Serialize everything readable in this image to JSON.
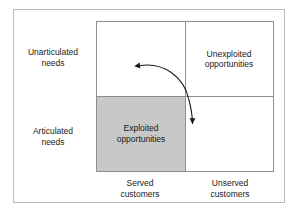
{
  "figure": {
    "colors": {
      "shaded_quadrant": "#c8c8c8",
      "matrix_border": "#8d8d8d",
      "outer_frame": "#b9b9b9",
      "arrow": "#1a1a1a",
      "text": "#1a1a1a",
      "background": "#ffffff"
    }
  },
  "axes": {
    "vertical": {
      "upper_label": "Unarticulated\nneeds",
      "lower_label": "Articulated\nneeds"
    },
    "horizontal": {
      "left_label": "Served\ncustomers",
      "right_label": "Unserved\ncustomers"
    }
  },
  "quadrants": {
    "top_left": {
      "label": "",
      "shaded": false
    },
    "top_right": {
      "label": "Unexploited\nopportunities",
      "shaded": false
    },
    "bottom_left": {
      "label": "Exploited\nopportunities",
      "shaded": true
    },
    "bottom_right": {
      "label": "",
      "shaded": false
    }
  },
  "annotations": {
    "arrow": {
      "name": "double-headed-curved-arrow",
      "from_quadrant": "top_left",
      "to_quadrant": "bottom_right",
      "head_start": "arrowhead pointing left into unarticulated / served quadrant",
      "head_end": "arrowhead pointing down into articulated / unserved quadrant"
    }
  }
}
